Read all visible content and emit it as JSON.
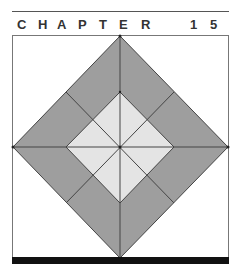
{
  "header": {
    "chapter_letters": [
      "C",
      "H",
      "A",
      "P",
      "T",
      "E",
      "R"
    ],
    "number_digits": [
      "1",
      "5"
    ],
    "chapter_label": "CHAPTER",
    "chapter_number": "15"
  },
  "figure": {
    "colors": {
      "outer_fill": "#9e9e9e",
      "inner_fill": "#e4e4e4",
      "line": "#444444",
      "frame": "#777777",
      "bottom_bar": "#111111",
      "text": "#333333"
    }
  }
}
